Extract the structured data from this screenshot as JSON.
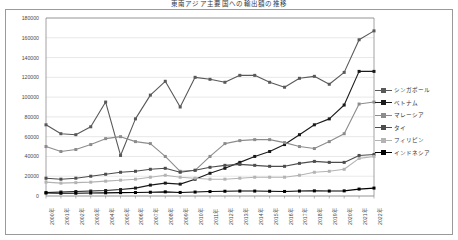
{
  "chart_title": "東南アジア主要国への輸出額の推移",
  "axis": {
    "y_ticks": [
      "180000",
      "160000",
      "140000",
      "120000",
      "100000",
      "80000",
      "60000",
      "40000",
      "20000",
      "0"
    ],
    "x_ticks": [
      "2000年",
      "2001年",
      "2002年",
      "2003年",
      "2004年",
      "2005年",
      "2006年",
      "2007年",
      "2008年",
      "2009年",
      "2010年",
      "2011年",
      "2012年",
      "2013年",
      "2014年",
      "2015年",
      "2016年",
      "2017年",
      "2018年",
      "2019年",
      "2020年",
      "2021年",
      "2022年"
    ]
  },
  "legend": {
    "position": "right",
    "items": [
      {
        "label": "シンガポール",
        "color": "#595959"
      },
      {
        "label": "ベトナム",
        "color": "#1a1a1a"
      },
      {
        "label": "マレーシア",
        "color": "#8c8c8c"
      },
      {
        "label": "タイ",
        "color": "#4d4d4d"
      },
      {
        "label": "フィリピン",
        "color": "#b3b3b3"
      },
      {
        "label": "インドネシア",
        "color": "#000000"
      }
    ]
  },
  "chart_data": {
    "type": "line",
    "title": "東南アジア主要国への輸出額の推移",
    "xlabel": "",
    "ylabel": "",
    "ylim": [
      0,
      180000
    ],
    "grid": true,
    "legend_position": "right",
    "categories": [
      "2000年",
      "2001年",
      "2002年",
      "2003年",
      "2004年",
      "2005年",
      "2006年",
      "2007年",
      "2008年",
      "2009年",
      "2010年",
      "2011年",
      "2012年",
      "2013年",
      "2014年",
      "2015年",
      "2016年",
      "2017年",
      "2018年",
      "2019年",
      "2020年",
      "2021年",
      "2022年"
    ],
    "series": [
      {
        "name": "シンガポール",
        "color": "#595959",
        "values": [
          72000,
          63000,
          62000,
          70000,
          95000,
          41000,
          78000,
          102000,
          116000,
          90000,
          120000,
          118000,
          115000,
          122000,
          122000,
          115000,
          110000,
          119000,
          121000,
          113000,
          125000,
          158000,
          167000
        ]
      },
      {
        "name": "ベトナム",
        "color": "#1a1a1a",
        "values": [
          3500,
          4000,
          4500,
          5000,
          5500,
          6500,
          8000,
          11000,
          13000,
          12000,
          17000,
          23000,
          28000,
          34000,
          40000,
          45000,
          52000,
          62000,
          72000,
          78000,
          92000,
          126000,
          126000
        ]
      },
      {
        "name": "マレーシア",
        "color": "#8c8c8c",
        "values": [
          50000,
          45000,
          47000,
          52000,
          58000,
          60000,
          55000,
          53000,
          40000,
          25000,
          26000,
          40000,
          53000,
          56000,
          57000,
          57000,
          54000,
          50000,
          48000,
          55000,
          63000,
          93000,
          95000
        ]
      },
      {
        "name": "タイ",
        "color": "#4d4d4d",
        "values": [
          18000,
          17000,
          18000,
          20000,
          22000,
          24000,
          25000,
          27000,
          28000,
          24000,
          26000,
          29000,
          31000,
          32000,
          31000,
          30000,
          30000,
          33000,
          35000,
          34000,
          34000,
          41000,
          42000
        ]
      },
      {
        "name": "フィリピン",
        "color": "#b3b3b3",
        "values": [
          14000,
          13000,
          13500,
          14000,
          15000,
          16000,
          17000,
          19000,
          21000,
          19000,
          18000,
          17000,
          17000,
          18000,
          19000,
          19000,
          19000,
          21000,
          24000,
          25000,
          27000,
          38000,
          40000
        ]
      },
      {
        "name": "インドネシア",
        "color": "#000000",
        "values": [
          3000,
          2800,
          2800,
          3000,
          3200,
          3400,
          3500,
          3800,
          4200,
          3600,
          4000,
          4500,
          4800,
          5000,
          5000,
          4800,
          4600,
          5000,
          5200,
          5000,
          5200,
          7000,
          8000
        ]
      }
    ]
  }
}
